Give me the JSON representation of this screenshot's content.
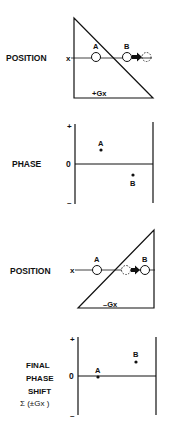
{
  "panels": [
    {
      "type": "position",
      "row_label": "POSITION",
      "axis_label": "x",
      "gradient_label": "+Gx",
      "points": [
        {
          "label": "A",
          "style": "solid"
        },
        {
          "label": "B",
          "style": "solid"
        },
        {
          "label": "",
          "style": "dashed"
        }
      ]
    },
    {
      "type": "phase",
      "row_label": "PHASE",
      "plus": "+",
      "zero": "0",
      "minus": "–",
      "points": [
        {
          "label": "A",
          "phase": "positive"
        },
        {
          "label": "B",
          "phase": "negative"
        }
      ]
    },
    {
      "type": "position",
      "row_label": "POSITION",
      "axis_label": "x",
      "gradient_label": "–Gx",
      "points": [
        {
          "label": "A",
          "style": "solid"
        },
        {
          "label": "",
          "style": "dashed"
        },
        {
          "label": "B",
          "style": "solid"
        }
      ]
    },
    {
      "type": "phase",
      "row_label_lines": [
        "FINAL",
        "PHASE",
        "SHIFT",
        "Σ (±Gx )"
      ],
      "plus": "+",
      "zero": "0",
      "minus": "–",
      "points": [
        {
          "label": "A",
          "phase": "zero"
        },
        {
          "label": "B",
          "phase": "positive"
        }
      ]
    }
  ]
}
